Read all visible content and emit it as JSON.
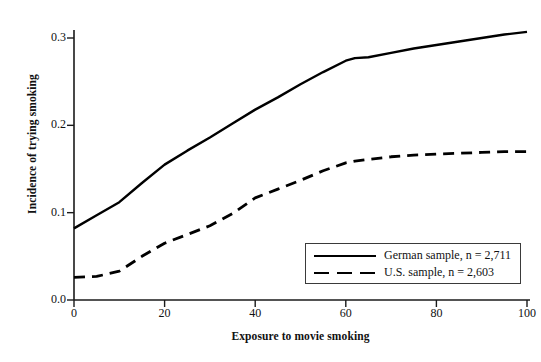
{
  "chart_data": {
    "type": "line",
    "title": "",
    "xlabel": "Exposure to movie smoking",
    "ylabel": "Incidence of trying smoking",
    "xlim": [
      0,
      100
    ],
    "ylim": [
      0.0,
      0.32
    ],
    "xticks": [
      "0",
      "20",
      "40",
      "60",
      "80",
      "100"
    ],
    "xtick_values": [
      0,
      20,
      40,
      60,
      80,
      100
    ],
    "yticks": [
      "0.0",
      "0.1",
      "0.2",
      "0.3"
    ],
    "ytick_values": [
      0.0,
      0.1,
      0.2,
      0.3
    ],
    "grid": false,
    "legend_position": "lower right",
    "x": [
      0,
      5,
      10,
      15,
      20,
      25,
      30,
      35,
      40,
      45,
      50,
      55,
      60,
      62,
      65,
      70,
      75,
      80,
      85,
      90,
      95,
      100
    ],
    "series": [
      {
        "name": "German sample, n = 2,711",
        "style": "solid",
        "color": "#000000",
        "values": [
          0.082,
          0.097,
          0.112,
          0.134,
          0.155,
          0.171,
          0.186,
          0.202,
          0.218,
          0.232,
          0.247,
          0.261,
          0.274,
          0.277,
          0.278,
          0.283,
          0.288,
          0.292,
          0.296,
          0.3,
          0.304,
          0.307
        ]
      },
      {
        "name": "U.S. sample, n = 2,603",
        "style": "dashed",
        "color": "#000000",
        "values": [
          0.026,
          0.027,
          0.033,
          0.05,
          0.065,
          0.075,
          0.085,
          0.099,
          0.117,
          0.127,
          0.137,
          0.148,
          0.157,
          0.159,
          0.161,
          0.164,
          0.166,
          0.167,
          0.168,
          0.169,
          0.17,
          0.17
        ]
      }
    ]
  },
  "legend": {
    "entries": [
      {
        "label": "German sample, n = 2,711",
        "style": "solid"
      },
      {
        "label": "U.S. sample, n = 2,603",
        "style": "dashed"
      }
    ]
  },
  "axes": {
    "y_title": "Incidence of trying smoking",
    "x_title": "Exposure to movie smoking",
    "y_labels": [
      "0.3",
      "0.2",
      "0.1",
      "0.0"
    ],
    "x_labels": [
      "0",
      "20",
      "40",
      "60",
      "80",
      "100"
    ]
  }
}
